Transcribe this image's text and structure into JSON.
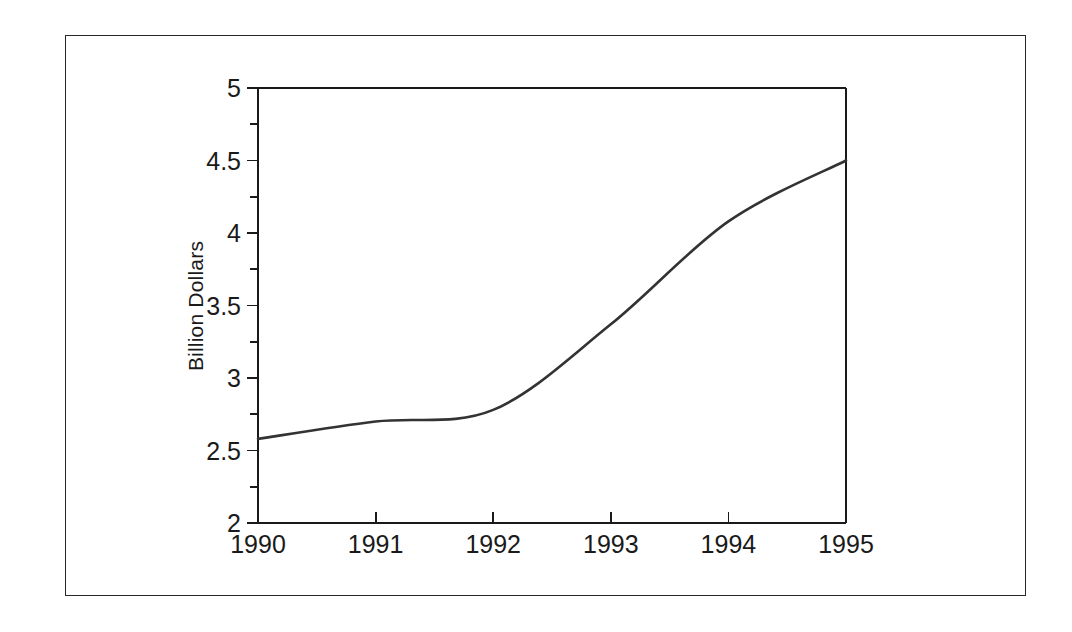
{
  "chart_data": {
    "type": "line",
    "title": "",
    "xlabel": "",
    "ylabel": "Billion Dollars",
    "xlim": [
      1990,
      1995
    ],
    "ylim": [
      2,
      5
    ],
    "grid": false,
    "legend": false,
    "x": [
      1990,
      1991,
      1992,
      1993,
      1994,
      1995
    ],
    "values": [
      2.58,
      2.7,
      2.78,
      3.37,
      4.08,
      4.5
    ],
    "series": [
      {
        "name": "Billion Dollars",
        "values": [
          2.58,
          2.7,
          2.78,
          3.37,
          4.08,
          4.5
        ],
        "color": "#333333"
      }
    ],
    "x_tick_labels": [
      "1990",
      "1991",
      "1992",
      "1993",
      "1994",
      "1995"
    ],
    "x_tick_values": [
      1990,
      1991,
      1992,
      1993,
      1994,
      1995
    ],
    "y_tick_labels": [
      "2",
      "2.5",
      "3",
      "3.5",
      "4",
      "4.5",
      "5"
    ],
    "y_tick_values": [
      2,
      2.5,
      3,
      3.5,
      4,
      4.5,
      5
    ],
    "y_minor_tick_values": [
      2.25,
      2.75,
      3.25,
      3.75,
      4.25,
      4.75
    ],
    "line_color": "#333333",
    "axis_color": "#1a1a1a",
    "background_color": "#ffffff"
  }
}
